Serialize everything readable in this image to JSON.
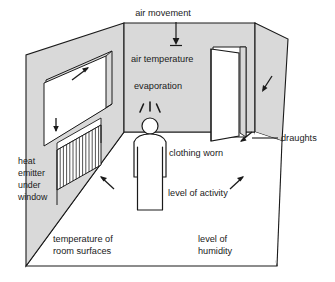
{
  "diagram": {
    "type": "perspective-room-illustration",
    "colors": {
      "wall_fill": "#d9d9d9",
      "floor_fill": "#ffffff",
      "line": "#1a1a1a",
      "text": "#1a1a1a",
      "background": "#ffffff",
      "window_fill": "#ffffff",
      "door_fill": "#ffffff"
    },
    "labels": [
      {
        "id": "air-movement",
        "text": "air movement",
        "lines": [
          "air movement"
        ]
      },
      {
        "id": "air-temperature",
        "text": "air temperature",
        "lines": [
          "air temperature"
        ]
      },
      {
        "id": "evaporation",
        "text": "evaporation",
        "lines": [
          "evaporation"
        ]
      },
      {
        "id": "draughts",
        "text": "draughts",
        "lines": [
          "draughts"
        ]
      },
      {
        "id": "clothing-worn",
        "text": "clothing worn",
        "lines": [
          "clothing worn"
        ]
      },
      {
        "id": "level-of-activity",
        "text": "level of activity",
        "lines": [
          "level of activity"
        ]
      },
      {
        "id": "heat-emitter",
        "text": "heat emitter under window",
        "lines": [
          "heat",
          "emitter",
          "under",
          "window"
        ]
      },
      {
        "id": "temperature-surfaces",
        "text": "temperature of room surfaces",
        "lines": [
          "temperature of",
          "room surfaces"
        ]
      },
      {
        "id": "level-of-humidity",
        "text": "level of humidity",
        "lines": [
          "level of",
          "humidity"
        ]
      }
    ],
    "objects": [
      {
        "id": "back-wall",
        "name": "back wall"
      },
      {
        "id": "left-wall",
        "name": "left wall"
      },
      {
        "id": "right-wall",
        "name": "right wall"
      },
      {
        "id": "floor",
        "name": "floor"
      },
      {
        "id": "window",
        "name": "window on left wall"
      },
      {
        "id": "radiator",
        "name": "heat emitter / radiator under window"
      },
      {
        "id": "door",
        "name": "open door in back wall"
      },
      {
        "id": "person",
        "name": "standing person figure"
      }
    ],
    "annotations": {
      "air_movement_arrow": "vertical arrow pointing down into room",
      "evaporation_rays": "three short rays radiating upward from head",
      "draughts_arrows": "two diagonal arrows near open door",
      "window_arrow": "diagonal arrow pointing up-right at window",
      "radiator_arrow": "short vertical arrow above radiator",
      "floor_arrow_left": "diagonal arrow pointing up-left on floor",
      "floor_arrow_right": "diagonal arrow pointing up-right on floor"
    }
  }
}
